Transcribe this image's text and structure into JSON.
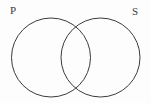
{
  "figure": {
    "type": "venn-diagram",
    "width": 151,
    "height": 103,
    "background_color": "#fdfdfd",
    "stroke_color": "#3b3b3b",
    "stroke_width": 1,
    "fill": "none"
  },
  "labels": {
    "left": "P",
    "right": "S"
  },
  "circles": [
    {
      "name": "left-circle",
      "label": "P",
      "cx": 51,
      "cy": 57.5,
      "r": 39.5
    },
    {
      "name": "right-circle",
      "label": "S",
      "cx": 100.5,
      "cy": 57.5,
      "r": 39.5
    }
  ],
  "intersections": [
    {
      "name": "upper-intersection",
      "x": 75.75,
      "y": 22.6
    },
    {
      "name": "lower-intersection",
      "x": 75.75,
      "y": 92.4
    }
  ]
}
